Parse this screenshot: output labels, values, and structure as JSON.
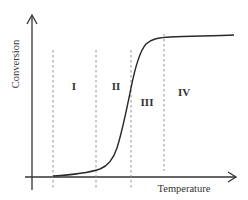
{
  "diagram": {
    "type": "conversion-vs-temperature sketch",
    "y_axis_label": "Conversion",
    "x_axis_label": "Temperature",
    "regions": [
      {
        "label": "I"
      },
      {
        "label": "II"
      },
      {
        "label": "III"
      },
      {
        "label": "IV"
      }
    ],
    "curve": "sigmoidal (S-shaped) conversion curve: low plateau, steep rise, high plateau"
  },
  "colors": {
    "axis": "#333333",
    "curve": "#2a2a2a",
    "dashed": "#888888",
    "background": "#ffffff"
  }
}
